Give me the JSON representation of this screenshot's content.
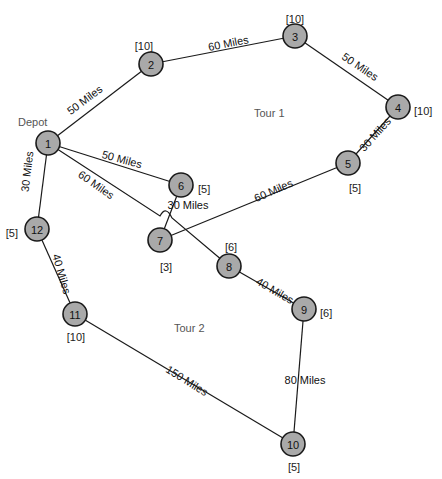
{
  "nodes": [
    {
      "id": "1",
      "demand": ""
    },
    {
      "id": "2",
      "demand": "[10]"
    },
    {
      "id": "3",
      "demand": "[10]"
    },
    {
      "id": "4",
      "demand": "[10]"
    },
    {
      "id": "5",
      "demand": "[5]"
    },
    {
      "id": "6",
      "demand": "[5]"
    },
    {
      "id": "7",
      "demand": "[3]"
    },
    {
      "id": "8",
      "demand": "[6]"
    },
    {
      "id": "9",
      "demand": "[6]"
    },
    {
      "id": "10",
      "demand": "[5]"
    },
    {
      "id": "11",
      "demand": "[10]"
    },
    {
      "id": "12",
      "demand": "[5]"
    }
  ],
  "depot_label": "Depot",
  "edges": [
    {
      "from": "1",
      "to": "2",
      "label": "50 Miles"
    },
    {
      "from": "2",
      "to": "3",
      "label": "60 Miles"
    },
    {
      "from": "3",
      "to": "4",
      "label": "50 Miles"
    },
    {
      "from": "4",
      "to": "5",
      "label": "30 Miles"
    },
    {
      "from": "5",
      "to": "7",
      "label": "60 Miles"
    },
    {
      "from": "7",
      "to": "6",
      "label": "30 Miles"
    },
    {
      "from": "6",
      "to": "1",
      "label": "50 Miles"
    },
    {
      "from": "1",
      "to": "8",
      "label": "60 Miles"
    },
    {
      "from": "8",
      "to": "9",
      "label": "40 Miles"
    },
    {
      "from": "9",
      "to": "10",
      "label": "80 Miles"
    },
    {
      "from": "10",
      "to": "11",
      "label": "150 Miles"
    },
    {
      "from": "11",
      "to": "12",
      "label": "40 Miles"
    },
    {
      "from": "12",
      "to": "1",
      "label": "30 Miles"
    }
  ],
  "tours": [
    {
      "label": "Tour 1"
    },
    {
      "label": "Tour 2"
    }
  ]
}
